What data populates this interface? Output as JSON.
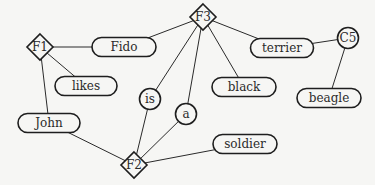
{
  "diagram": {
    "type": "semantic-network",
    "nodes": [
      {
        "id": "F1",
        "label": "F1",
        "shape": "diamond",
        "x": 40,
        "y": 47
      },
      {
        "id": "F2",
        "label": "F2",
        "shape": "diamond",
        "x": 134,
        "y": 165
      },
      {
        "id": "F3",
        "label": "F3",
        "shape": "diamond",
        "x": 203,
        "y": 17
      },
      {
        "id": "C5",
        "label": "C5",
        "shape": "circle",
        "x": 348,
        "y": 38
      },
      {
        "id": "is",
        "label": "is",
        "shape": "circle",
        "x": 150,
        "y": 99
      },
      {
        "id": "a",
        "label": "a",
        "shape": "circle",
        "x": 186,
        "y": 114
      },
      {
        "id": "Fido",
        "label": "Fido",
        "shape": "pill",
        "x": 124,
        "y": 47,
        "w": 64
      },
      {
        "id": "likes",
        "label": "likes",
        "shape": "pill",
        "x": 86,
        "y": 86,
        "w": 62
      },
      {
        "id": "John",
        "label": "John",
        "shape": "pill",
        "x": 49,
        "y": 123,
        "w": 62
      },
      {
        "id": "terrier",
        "label": "terrier",
        "shape": "pill",
        "x": 282,
        "y": 48,
        "w": 63
      },
      {
        "id": "black",
        "label": "black",
        "shape": "pill",
        "x": 244,
        "y": 87,
        "w": 64
      },
      {
        "id": "beagle",
        "label": "beagle",
        "shape": "pill",
        "x": 329,
        "y": 98,
        "w": 64
      },
      {
        "id": "soldier",
        "label": "soldier",
        "shape": "pill",
        "x": 245,
        "y": 144,
        "w": 64
      }
    ],
    "edges": [
      [
        "F1",
        "Fido"
      ],
      [
        "F1",
        "likes"
      ],
      [
        "F1",
        "John"
      ],
      [
        "F3",
        "Fido"
      ],
      [
        "F3",
        "terrier"
      ],
      [
        "F3",
        "black"
      ],
      [
        "F3",
        "is"
      ],
      [
        "F3",
        "a"
      ],
      [
        "terrier",
        "C5"
      ],
      [
        "C5",
        "beagle"
      ],
      [
        "John",
        "F2"
      ],
      [
        "is",
        "F2"
      ],
      [
        "a",
        "F2"
      ],
      [
        "soldier",
        "F2"
      ]
    ]
  }
}
